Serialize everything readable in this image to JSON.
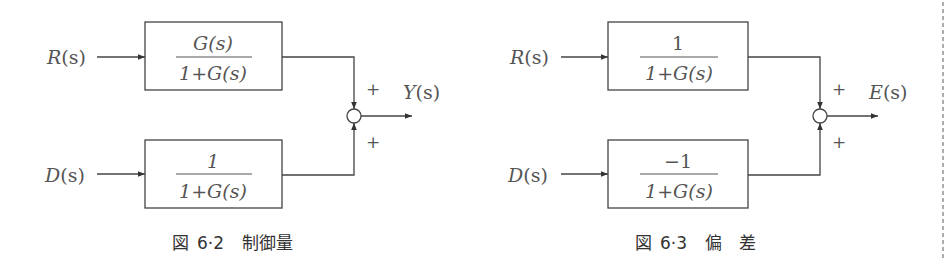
{
  "colors": {
    "line": "#444444",
    "text": "#555555",
    "caption": "#333333",
    "background": "#ffffff",
    "divider": "#777777"
  },
  "figures": [
    {
      "id": "fig-6-2",
      "caption": {
        "prefix": "図",
        "number": "6·2",
        "title": "制御量"
      },
      "inputs": [
        {
          "symbol": "R",
          "arg": "(s)"
        },
        {
          "symbol": "D",
          "arg": "(s)"
        }
      ],
      "blocks": [
        {
          "numerator": "G(s)",
          "denominator": "1+G(s)"
        },
        {
          "numerator": "1",
          "denominator": "1+G(s)"
        }
      ],
      "summing_signs": [
        "+",
        "+"
      ],
      "output": {
        "symbol": "Y",
        "arg": "(s)"
      }
    },
    {
      "id": "fig-6-3",
      "caption": {
        "prefix": "図",
        "number": "6·3",
        "title": "偏　差"
      },
      "inputs": [
        {
          "symbol": "R",
          "arg": "(s)"
        },
        {
          "symbol": "D",
          "arg": "(s)"
        }
      ],
      "blocks": [
        {
          "numerator": "1",
          "denominator": "1+G(s)"
        },
        {
          "numerator": "−1",
          "denominator": "1+G(s)"
        }
      ],
      "summing_signs": [
        "+",
        "+"
      ],
      "output": {
        "symbol": "E",
        "arg": "(s)"
      }
    }
  ]
}
